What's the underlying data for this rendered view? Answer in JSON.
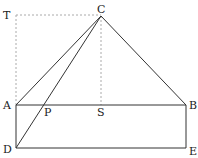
{
  "diagram": {
    "points": {
      "T": {
        "label": "T",
        "x": 16,
        "y": 15
      },
      "C": {
        "label": "C",
        "x": 101,
        "y": 16
      },
      "A": {
        "label": "A",
        "x": 16,
        "y": 105
      },
      "B": {
        "label": "B",
        "x": 186,
        "y": 105
      },
      "P": {
        "label": "P",
        "x": 45,
        "y": 105
      },
      "S": {
        "label": "S",
        "x": 101,
        "y": 105
      },
      "D": {
        "label": "D",
        "x": 16,
        "y": 148
      },
      "E": {
        "label": "E",
        "x": 186,
        "y": 148
      }
    },
    "solid_segments": [
      "AC",
      "BC",
      "DC",
      "AB",
      "AD",
      "DE",
      "BE"
    ],
    "dotted_segments": [
      "TC",
      "TA",
      "CS"
    ],
    "colors": {
      "line": "#333333",
      "dotted": "#aaaaaa",
      "label": "#222222"
    }
  }
}
